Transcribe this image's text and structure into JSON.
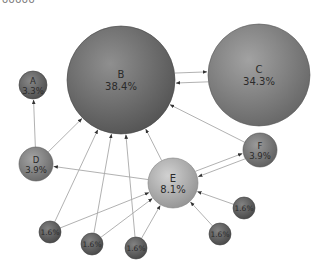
{
  "title": "ooooo",
  "nodes": [
    {
      "id": "B",
      "name": "B",
      "pct": "38.4%",
      "cx": 121,
      "cy": 80,
      "r": 54,
      "color": "#6f6f6f"
    },
    {
      "id": "C",
      "name": "C",
      "pct": "34.3%",
      "cx": 259,
      "cy": 75,
      "r": 51,
      "color": "#888888"
    },
    {
      "id": "A",
      "name": "A",
      "pct": "3.3%",
      "cx": 33,
      "cy": 85,
      "r": 14,
      "color": "#666666"
    },
    {
      "id": "D",
      "name": "D",
      "pct": "3.9%",
      "cx": 36,
      "cy": 164,
      "r": 17,
      "color": "#8a8a8a"
    },
    {
      "id": "E",
      "name": "E",
      "pct": "8.1%",
      "cx": 173,
      "cy": 183,
      "r": 25,
      "color": "#c4c4c4"
    },
    {
      "id": "F",
      "name": "F",
      "pct": "3.9%",
      "cx": 260,
      "cy": 150,
      "r": 17,
      "color": "#7d7d7d"
    },
    {
      "id": "n1",
      "name": "",
      "pct": "1.6%",
      "cx": 50,
      "cy": 232,
      "r": 11,
      "color": "#5f5f5f"
    },
    {
      "id": "n2",
      "name": "",
      "pct": "1.6%",
      "cx": 92,
      "cy": 244,
      "r": 11,
      "color": "#5f5f5f"
    },
    {
      "id": "n3",
      "name": "",
      "pct": "1.6%",
      "cx": 136,
      "cy": 248,
      "r": 11,
      "color": "#5f5f5f"
    },
    {
      "id": "n4",
      "name": "",
      "pct": "1.6%",
      "cx": 244,
      "cy": 208,
      "r": 11,
      "color": "#5f5f5f"
    },
    {
      "id": "n5",
      "name": "",
      "pct": "1.6%",
      "cx": 220,
      "cy": 234,
      "r": 11,
      "color": "#5f5f5f"
    }
  ],
  "edges": [
    {
      "from": "B",
      "to": "C",
      "offset": -5
    },
    {
      "from": "C",
      "to": "B",
      "offset": -5
    },
    {
      "from": "D",
      "to": "A",
      "offset": 0
    },
    {
      "from": "D",
      "to": "B",
      "offset": 0
    },
    {
      "from": "E",
      "to": "D",
      "offset": 0
    },
    {
      "from": "E",
      "to": "B",
      "offset": 0
    },
    {
      "from": "E",
      "to": "F",
      "offset": -3
    },
    {
      "from": "F",
      "to": "E",
      "offset": -3
    },
    {
      "from": "F",
      "to": "B",
      "offset": 0
    },
    {
      "from": "n1",
      "to": "B",
      "offset": 0
    },
    {
      "from": "n1",
      "to": "E",
      "offset": 0
    },
    {
      "from": "n2",
      "to": "B",
      "offset": 0
    },
    {
      "from": "n2",
      "to": "E",
      "offset": 0
    },
    {
      "from": "n3",
      "to": "B",
      "offset": 0
    },
    {
      "from": "n3",
      "to": "E",
      "offset": 0
    },
    {
      "from": "n4",
      "to": "E",
      "offset": 0
    },
    {
      "from": "n5",
      "to": "E",
      "offset": 0
    }
  ]
}
